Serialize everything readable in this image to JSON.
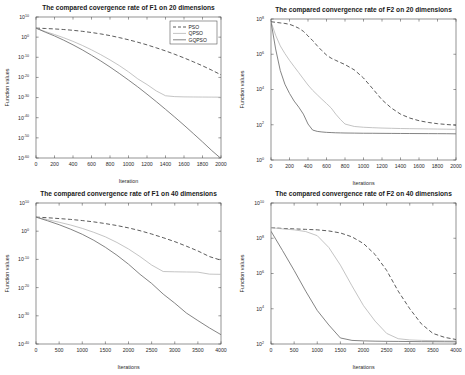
{
  "figure": {
    "background": "#ffffff",
    "series_styles": {
      "PSO": {
        "color": "#3f3f3f",
        "dash": "4,2.4",
        "width": 0.85
      },
      "QPSO": {
        "color": "#b9b9b9",
        "dash": "none",
        "width": 0.85
      },
      "GQPSO": {
        "color": "#6e6e6e",
        "dash": "none",
        "width": 0.85
      }
    }
  },
  "chart_data": [
    {
      "id": "f1-20d",
      "type": "line",
      "title": "The compared covergence rate of F1 on 20 dimensions",
      "xlabel": "Iteration",
      "ylabel": "Function values",
      "yscale": "log",
      "xlim": [
        0,
        2000
      ],
      "ylim": [
        1e-60,
        10000000000.0
      ],
      "xticks": [
        0,
        200,
        400,
        600,
        800,
        1000,
        1200,
        1400,
        1600,
        1800,
        2000
      ],
      "yticks": [
        10000000000.0,
        1.0,
        1e-10,
        1e-20,
        1e-30,
        1e-40,
        1e-50,
        1e-60
      ],
      "ytick_labels": [
        "10^10",
        "10^0",
        "10^-10",
        "10^-20",
        "10^-30",
        "10^-40",
        "10^-50",
        "10^-60"
      ],
      "grid": false,
      "legend": {
        "position": "top-right",
        "entries": [
          "PSO",
          "QPSO",
          "GQPSO"
        ]
      },
      "x": [
        0,
        100,
        200,
        300,
        400,
        500,
        600,
        700,
        800,
        900,
        1000,
        1100,
        1200,
        1300,
        1400,
        1500,
        1600,
        1700,
        1800,
        1900,
        2000
      ],
      "series": [
        {
          "name": "PSO",
          "values": [
            30000.0,
            20000.0,
            12000.0,
            6000.0,
            2500.0,
            800.0,
            200.0,
            40.0,
            6.0,
            0.6,
            0.05,
            0.003,
            0.00015,
            5e-06,
            1.5e-07,
            3e-09,
            5e-11,
            6e-13,
            6e-15,
            4e-17,
            2e-19
          ]
        },
        {
          "name": "QPSO",
          "values": [
            30000.0,
            600.0,
            20.0,
            0.5,
            0.008,
            8e-05,
            5e-07,
            2e-09,
            5e-12,
            8e-15,
            6e-18,
            2e-21,
            3e-24,
            2e-27,
            8e-30,
            3e-30,
            2.2e-30,
            2e-30,
            1.8e-30,
            1.7e-30,
            1.6e-30
          ]
        },
        {
          "name": "GQPSO",
          "values": [
            30000.0,
            300.0,
            4.0,
            0.03,
            0.00015,
            5e-07,
            1e-09,
            1.5e-12,
            1.5e-15,
            1e-18,
            5e-22,
            2e-25,
            5e-29,
            1e-32,
            1.5e-36,
            2e-40,
            2e-44,
            1.5e-48,
            1e-52,
            5e-57,
            2e-61
          ]
        }
      ]
    },
    {
      "id": "f2-20d",
      "type": "line",
      "title": "The compared convergence rate of F2 on 20 dimensions",
      "xlabel": "Iterations",
      "ylabel": "Function values",
      "yscale": "log",
      "xlim": [
        0,
        2000
      ],
      "ylim": [
        1.0,
        100000000.0
      ],
      "xticks": [
        0,
        200,
        400,
        600,
        800,
        1000,
        1200,
        1400,
        1600,
        1800,
        2000
      ],
      "yticks": [
        100000000.0,
        1000000.0,
        10000.0,
        100.0,
        1.0
      ],
      "ytick_labels": [
        "10^8",
        "10^6",
        "10^4",
        "10^2",
        "10^0"
      ],
      "grid": false,
      "legend": null,
      "x": [
        0,
        50,
        100,
        150,
        200,
        250,
        300,
        350,
        400,
        450,
        500,
        550,
        600,
        650,
        700,
        750,
        800,
        900,
        1000,
        1100,
        1200,
        1300,
        1400,
        1500,
        1600,
        1700,
        1800,
        1900,
        2000
      ],
      "series": [
        {
          "name": "PSO",
          "values": [
            70000000.0,
            65000000.0,
            60000000.0,
            56000000.0,
            50000000.0,
            40000000.0,
            30000000.0,
            20000000.0,
            11000000.0,
            6000000.0,
            3000000.0,
            1600000.0,
            900000.0,
            600000.0,
            450000.0,
            340000.0,
            260000.0,
            130000.0,
            45000.0,
            11000.0,
            2600.0,
            900.0,
            400.0,
            240.0,
            170.0,
            135.0,
            115.0,
            103.0,
            94.0
          ]
        },
        {
          "name": "QPSO",
          "values": [
            70000000.0,
            12000000.0,
            3000000.0,
            1100000.0,
            450000.0,
            200000.0,
            90000.0,
            40000.0,
            18000.0,
            9000.0,
            5000.0,
            2800.0,
            1600.0,
            900.0,
            400.0,
            200.0,
            110.0,
            80.0,
            72.0,
            68.0,
            65.0,
            63.0,
            61.0,
            60.0,
            59.0,
            58.0,
            57.0,
            56.0,
            55.0
          ]
        },
        {
          "name": "GQPSO",
          "values": [
            70000000.0,
            2000000.0,
            120000.0,
            20000.0,
            6000.0,
            2200.0,
            1000.0,
            400.0,
            110.0,
            50.0,
            42.0,
            39.0,
            37.0,
            36.0,
            35.0,
            34.5,
            34.0,
            33.5,
            33.0,
            32.8,
            32.5,
            32.2,
            32.0,
            31.8,
            31.6,
            31.4,
            31.2,
            31.0,
            30.5
          ]
        }
      ]
    },
    {
      "id": "f1-40d",
      "type": "line",
      "title": "The compared convergence rate of F1 on 40 dimensions",
      "xlabel": "Iterations",
      "ylabel": "Function values",
      "yscale": "log",
      "xlim": [
        0,
        4000
      ],
      "ylim": [
        1e-40,
        10000000000.0
      ],
      "xticks": [
        0,
        500,
        1000,
        1500,
        2000,
        2500,
        3000,
        3500,
        4000
      ],
      "yticks": [
        10000000000.0,
        1.0,
        1e-10,
        1e-20,
        1e-30,
        1e-40
      ],
      "ytick_labels": [
        "10^10",
        "10^0",
        "10^-10",
        "10^-20",
        "10^-30",
        "10^-40"
      ],
      "grid": false,
      "legend": null,
      "x": [
        0,
        250,
        500,
        750,
        1000,
        1250,
        1500,
        1750,
        2000,
        2250,
        2500,
        2750,
        3000,
        3250,
        3500,
        3750,
        4000
      ],
      "series": [
        {
          "name": "PSO",
          "values": [
            100000.0,
            60000.0,
            30000.0,
            15000.0,
            6000.0,
            2000.0,
            500.0,
            100.0,
            15.0,
            1.5,
            0.1,
            0.005,
            0.0002,
            5e-06,
            1e-07,
            1e-09,
            5e-11
          ]
        },
        {
          "name": "QPSO",
          "values": [
            100000.0,
            12000.0,
            1500.0,
            150.0,
            10.0,
            0.4,
            0.01,
            0.0001,
            5e-07,
            1e-09,
            1e-12,
            5e-15,
            4e-15,
            3.5e-15,
            3e-15,
            6e-16,
            5e-16
          ]
        },
        {
          "name": "GQPSO",
          "values": [
            100000.0,
            5000.0,
            200.0,
            5.0,
            0.08,
            0.0006,
            2e-06,
            3e-09,
            2e-12,
            5e-16,
            3e-19,
            5e-23,
            3e-26,
            1e-29,
            2e-32,
            5e-35,
            2e-37
          ]
        }
      ]
    },
    {
      "id": "f2-40d",
      "type": "line",
      "title": "The compared convergence rate of F2 on 40 dimensions",
      "xlabel": "Iterations",
      "ylabel": "Function values",
      "yscale": "log",
      "xlim": [
        0,
        4000
      ],
      "ylim": [
        100.0,
        10000000000.0
      ],
      "xticks": [
        0,
        500,
        1000,
        1500,
        2000,
        2500,
        3000,
        3500,
        4000
      ],
      "yticks": [
        10000000000.0,
        100000000.0,
        1000000.0,
        10000.0,
        100.0
      ],
      "ytick_labels": [
        "10^10",
        "10^8",
        "10^6",
        "10^4",
        "10^2"
      ],
      "grid": false,
      "legend": null,
      "x": [
        0,
        250,
        500,
        750,
        1000,
        1250,
        1500,
        1750,
        2000,
        2250,
        2500,
        2750,
        3000,
        3250,
        3500,
        3750,
        4000
      ],
      "series": [
        {
          "name": "PSO",
          "values": [
            400000000.0,
            360000000.0,
            340000000.0,
            320000000.0,
            300000000.0,
            260000000.0,
            200000000.0,
            120000000.0,
            50000000.0,
            12000000.0,
            1500000.0,
            100000.0,
            10000.0,
            1400.0,
            400.0,
            240.0,
            180.0
          ]
        },
        {
          "name": "QPSO",
          "values": [
            400000000.0,
            340000000.0,
            300000000.0,
            240000000.0,
            140000000.0,
            30000000.0,
            3000000.0,
            200000.0,
            15000.0,
            2000.0,
            400.0,
            200.0,
            170.0,
            160.0,
            155.0,
            150.0,
            148.0
          ]
        },
        {
          "name": "GQPSO",
          "values": [
            250000000.0,
            20000000.0,
            1500000.0,
            100000.0,
            8000.0,
            1200.0,
            220.0,
            160.0,
            150.0,
            145.0,
            142.0,
            140.0,
            138.0,
            136.0,
            135.0,
            134.0,
            133.0
          ]
        }
      ]
    }
  ]
}
